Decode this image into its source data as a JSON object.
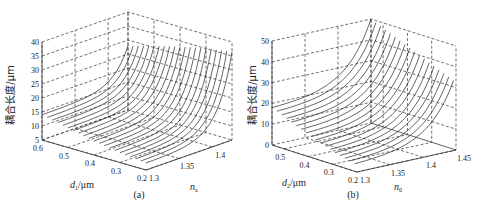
{
  "chart_data": [
    {
      "type": "surface3d",
      "panel_caption": "(a)",
      "zlabel": "耦合长度/μm",
      "xlabel_base": "d",
      "xlabel_sub": "1",
      "xlabel_unit": "/μm",
      "ylabel_base": "n",
      "ylabel_sub": "a",
      "x_ticks": [
        "0.6",
        "0.5",
        "0.4",
        "0.3",
        "0.2"
      ],
      "y_ticks": [
        "1.3",
        "1.35",
        "1.4"
      ],
      "z_ticks": [
        "5",
        "10",
        "15",
        "20",
        "25",
        "30",
        "35",
        "40"
      ],
      "x_range": [
        0.2,
        0.6
      ],
      "y_range": [
        1.3,
        1.43
      ],
      "z_range": [
        5,
        40
      ],
      "grid": true,
      "series": [
        {
          "name": "d=0.60",
          "d": 0.6,
          "z_at_n_min": 14.0,
          "z_at_n_max": 28.0
        },
        {
          "name": "d=0.58",
          "d": 0.58,
          "z_at_n_min": 13.6,
          "z_at_n_max": 28.5
        },
        {
          "name": "d=0.56",
          "d": 0.56,
          "z_at_n_min": 13.2,
          "z_at_n_max": 29.0
        },
        {
          "name": "d=0.54",
          "d": 0.54,
          "z_at_n_min": 12.8,
          "z_at_n_max": 29.5
        },
        {
          "name": "d=0.52",
          "d": 0.52,
          "z_at_n_min": 12.4,
          "z_at_n_max": 30.0
        },
        {
          "name": "d=0.50",
          "d": 0.5,
          "z_at_n_min": 12.0,
          "z_at_n_max": 30.5
        },
        {
          "name": "d=0.48",
          "d": 0.48,
          "z_at_n_min": 11.6,
          "z_at_n_max": 31.0
        },
        {
          "name": "d=0.46",
          "d": 0.46,
          "z_at_n_min": 11.2,
          "z_at_n_max": 31.5
        },
        {
          "name": "d=0.44",
          "d": 0.44,
          "z_at_n_min": 10.8,
          "z_at_n_max": 32.0
        },
        {
          "name": "d=0.42",
          "d": 0.42,
          "z_at_n_min": 10.4,
          "z_at_n_max": 32.5
        },
        {
          "name": "d=0.40",
          "d": 0.4,
          "z_at_n_min": 10.0,
          "z_at_n_max": 33.0
        },
        {
          "name": "d=0.38",
          "d": 0.38,
          "z_at_n_min": 9.7,
          "z_at_n_max": 33.4
        },
        {
          "name": "d=0.36",
          "d": 0.36,
          "z_at_n_min": 9.4,
          "z_at_n_max": 33.8
        },
        {
          "name": "d=0.34",
          "d": 0.34,
          "z_at_n_min": 9.1,
          "z_at_n_max": 34.2
        },
        {
          "name": "d=0.32",
          "d": 0.32,
          "z_at_n_min": 8.8,
          "z_at_n_max": 34.6
        },
        {
          "name": "d=0.30",
          "d": 0.3,
          "z_at_n_min": 8.5,
          "z_at_n_max": 35.0
        },
        {
          "name": "d=0.28",
          "d": 0.28,
          "z_at_n_min": 8.3,
          "z_at_n_max": 35.3
        },
        {
          "name": "d=0.26",
          "d": 0.26,
          "z_at_n_min": 8.1,
          "z_at_n_max": 35.6
        },
        {
          "name": "d=0.24",
          "d": 0.24,
          "z_at_n_min": 7.9,
          "z_at_n_max": 35.9
        },
        {
          "name": "d=0.22",
          "d": 0.22,
          "z_at_n_min": 7.7,
          "z_at_n_max": 36.2
        },
        {
          "name": "d=0.20",
          "d": 0.2,
          "z_at_n_min": 7.5,
          "z_at_n_max": 36.5
        }
      ]
    },
    {
      "type": "surface3d",
      "panel_caption": "(b)",
      "zlabel": "耦合长度/μm",
      "xlabel_base": "d",
      "xlabel_sub": "2",
      "xlabel_unit": "/μm",
      "ylabel_base": "n",
      "ylabel_sub": "0",
      "x_ticks": [
        "0.5",
        "0.4",
        "0.3",
        "0.2"
      ],
      "y_ticks": [
        "1.3",
        "1.35",
        "1.4",
        "1.45"
      ],
      "z_ticks": [
        "0",
        "10",
        "20",
        "30",
        "40",
        "50"
      ],
      "x_range": [
        0.2,
        0.55
      ],
      "y_range": [
        1.3,
        1.45
      ],
      "z_range": [
        0,
        50
      ],
      "grid": true,
      "series": [
        {
          "name": "d=0.55",
          "d": 0.55,
          "z_at_n_min": 18.0,
          "z_at_n_max": 50.0
        },
        {
          "name": "d=0.53",
          "d": 0.53,
          "z_at_n_min": 17.0,
          "z_at_n_max": 49.0
        },
        {
          "name": "d=0.51",
          "d": 0.51,
          "z_at_n_min": 16.0,
          "z_at_n_max": 48.0
        },
        {
          "name": "d=0.49",
          "d": 0.49,
          "z_at_n_min": 15.0,
          "z_at_n_max": 47.0
        },
        {
          "name": "d=0.47",
          "d": 0.47,
          "z_at_n_min": 14.0,
          "z_at_n_max": 46.0
        },
        {
          "name": "d=0.45",
          "d": 0.45,
          "z_at_n_min": 13.0,
          "z_at_n_max": 45.0
        },
        {
          "name": "d=0.43",
          "d": 0.43,
          "z_at_n_min": 12.0,
          "z_at_n_max": 44.0
        },
        {
          "name": "d=0.41",
          "d": 0.41,
          "z_at_n_min": 11.0,
          "z_at_n_max": 43.0
        },
        {
          "name": "d=0.39",
          "d": 0.39,
          "z_at_n_min": 10.0,
          "z_at_n_max": 42.0
        },
        {
          "name": "d=0.37",
          "d": 0.37,
          "z_at_n_min": 9.2,
          "z_at_n_max": 41.0
        },
        {
          "name": "d=0.35",
          "d": 0.35,
          "z_at_n_min": 8.4,
          "z_at_n_max": 40.0
        },
        {
          "name": "d=0.33",
          "d": 0.33,
          "z_at_n_min": 7.6,
          "z_at_n_max": 39.0
        },
        {
          "name": "d=0.31",
          "d": 0.31,
          "z_at_n_min": 6.8,
          "z_at_n_max": 38.0
        },
        {
          "name": "d=0.29",
          "d": 0.29,
          "z_at_n_min": 6.0,
          "z_at_n_max": 37.0
        },
        {
          "name": "d=0.27",
          "d": 0.27,
          "z_at_n_min": 5.4,
          "z_at_n_max": 36.0
        },
        {
          "name": "d=0.25",
          "d": 0.25,
          "z_at_n_min": 4.8,
          "z_at_n_max": 35.0
        },
        {
          "name": "d=0.23",
          "d": 0.23,
          "z_at_n_min": 4.2,
          "z_at_n_max": 34.0
        },
        {
          "name": "d=0.21",
          "d": 0.21,
          "z_at_n_min": 3.6,
          "z_at_n_max": 33.0
        }
      ]
    }
  ]
}
